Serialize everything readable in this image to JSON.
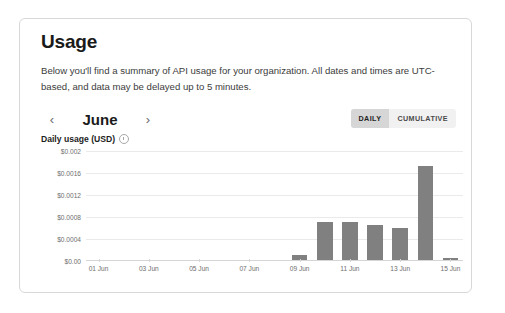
{
  "card": {
    "title": "Usage",
    "intro": "Below you'll find a summary of API usage for your organization. All dates and times are UTC-based, and data may be delayed up to 5 minutes."
  },
  "month_nav": {
    "prev_icon": "‹",
    "prev_icon_name": "chevron-left-icon",
    "month": "June",
    "next_icon": "›",
    "next_icon_name": "chevron-right-icon"
  },
  "view_toggle": {
    "options": [
      "DAILY",
      "CUMULATIVE"
    ],
    "selected": "DAILY"
  },
  "chart_header": {
    "title": "Daily usage (USD)",
    "info_icon": "info-circle-icon"
  },
  "colors": {
    "bar": "#808080",
    "gridline": "#eaeaea",
    "axis": "#d5d5d5",
    "card_border": "#d8d8d8",
    "toggle_active_bg": "#d6d6d6",
    "toggle_bg": "#f1f1f1"
  },
  "chart_data": {
    "type": "bar",
    "title": "Daily usage (USD)",
    "xlabel": "",
    "ylabel": "",
    "ylim": [
      0,
      0.002
    ],
    "grid": true,
    "legend": "none",
    "ytick_labels": [
      "$0.002",
      "$0.0016",
      "$0.0012",
      "$0.0008",
      "$0.0004",
      "$0.00"
    ],
    "ytick_values": [
      0.002,
      0.0016,
      0.0012,
      0.0008,
      0.0004,
      0.0
    ],
    "xtick_labels": [
      "01 Jun",
      "03 Jun",
      "05 Jun",
      "07 Jun",
      "09 Jun",
      "11 Jun",
      "13 Jun",
      "15 Jun"
    ],
    "categories": [
      "01 Jun",
      "02 Jun",
      "03 Jun",
      "04 Jun",
      "05 Jun",
      "06 Jun",
      "07 Jun",
      "08 Jun",
      "09 Jun",
      "10 Jun",
      "11 Jun",
      "12 Jun",
      "13 Jun",
      "14 Jun",
      "15 Jun"
    ],
    "values": [
      0,
      0,
      0,
      0,
      0,
      0,
      0,
      0,
      0.0001,
      0.0007,
      0.0007,
      0.00064,
      0.00059,
      0.00172,
      3e-05
    ]
  }
}
